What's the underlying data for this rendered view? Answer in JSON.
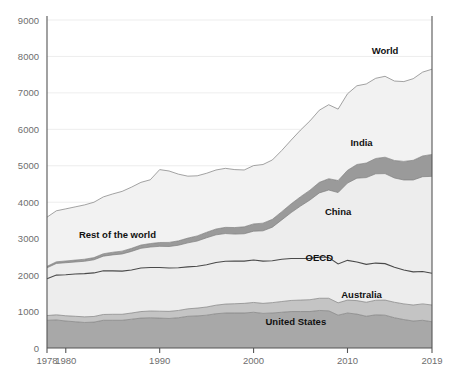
{
  "chart_data": {
    "type": "area",
    "title": "",
    "subtitle": "",
    "xlabel": "",
    "ylabel": "",
    "stacked": true,
    "grid": true,
    "legend_position": "inline-annotations",
    "xlim": [
      1978,
      2019
    ],
    "ylim": [
      0,
      9000
    ],
    "y_ticks": [
      0,
      1000,
      2000,
      3000,
      4000,
      5000,
      6000,
      7000,
      8000,
      9000
    ],
    "y_tick_labels": [
      "0",
      "1000",
      "2000",
      "3000",
      "4000",
      "5000",
      "6000",
      "7000",
      "8000",
      "9000"
    ],
    "x_ticks": [
      1978,
      1980,
      1990,
      2000,
      2010,
      2019
    ],
    "x_tick_labels": [
      "1978",
      "1980",
      "1990",
      "2000",
      "2010",
      "2019"
    ],
    "x": [
      1978,
      1979,
      1980,
      1981,
      1982,
      1983,
      1984,
      1985,
      1986,
      1987,
      1988,
      1989,
      1990,
      1991,
      1992,
      1993,
      1994,
      1995,
      1996,
      1997,
      1998,
      1999,
      2000,
      2001,
      2002,
      2003,
      2004,
      2005,
      2006,
      2007,
      2008,
      2009,
      2010,
      2011,
      2012,
      2013,
      2014,
      2015,
      2016,
      2017,
      2018,
      2019
    ],
    "series": [
      {
        "name": "United States",
        "label": "United States",
        "color": "#a8a8a8",
        "values": [
          760,
          770,
          740,
          720,
          700,
          710,
          760,
          760,
          760,
          790,
          820,
          830,
          820,
          810,
          830,
          870,
          880,
          900,
          940,
          960,
          960,
          960,
          980,
          950,
          960,
          980,
          1000,
          1000,
          1000,
          1030,
          1020,
          900,
          960,
          930,
          870,
          910,
          900,
          830,
          780,
          740,
          760,
          720
        ]
      },
      {
        "name": "Australia",
        "label": "Australia",
        "color": "#c4c4c4",
        "values": [
          130,
          140,
          145,
          150,
          155,
          155,
          160,
          165,
          165,
          170,
          180,
          185,
          190,
          195,
          200,
          205,
          215,
          225,
          235,
          245,
          255,
          265,
          270,
          275,
          285,
          295,
          305,
          315,
          325,
          335,
          345,
          340,
          355,
          370,
          385,
          400,
          415,
          425,
          430,
          440,
          450,
          460
        ]
      },
      {
        "name": "OECD (rest)",
        "label": "OECD",
        "color": "#ededed",
        "values": [
          1010,
          1090,
          1125,
          1160,
          1185,
          1195,
          1200,
          1190,
          1185,
          1180,
          1195,
          1195,
          1200,
          1190,
          1170,
          1150,
          1150,
          1160,
          1170,
          1175,
          1170,
          1160,
          1165,
          1160,
          1150,
          1160,
          1150,
          1140,
          1135,
          1130,
          1120,
          1065,
          1090,
          1060,
          1040,
          1020,
          1000,
          960,
          930,
          910,
          890,
          870
        ]
      },
      {
        "name": "China",
        "label": "China",
        "color": "#ededed",
        "values": [
          300,
          320,
          330,
          330,
          340,
          360,
          400,
          440,
          470,
          510,
          540,
          560,
          580,
          590,
          620,
          660,
          690,
          740,
          760,
          760,
          740,
          750,
          790,
          830,
          920,
          1080,
          1260,
          1440,
          1600,
          1760,
          1850,
          1960,
          2120,
          2300,
          2380,
          2450,
          2470,
          2450,
          2470,
          2520,
          2600,
          2660
        ]
      },
      {
        "name": "India",
        "label": "India",
        "color": "#9a9a9a",
        "values": [
          40,
          45,
          48,
          52,
          56,
          60,
          66,
          72,
          78,
          84,
          90,
          96,
          105,
          112,
          120,
          130,
          140,
          150,
          160,
          170,
          180,
          190,
          200,
          210,
          215,
          225,
          240,
          255,
          270,
          290,
          310,
          330,
          350,
          375,
          400,
          420,
          450,
          480,
          510,
          540,
          570,
          600
        ]
      },
      {
        "name": "Rest of the world",
        "label": "Rest of the world",
        "color": "#f2f2f2",
        "values": [
          1350,
          1400,
          1430,
          1460,
          1490,
          1520,
          1560,
          1600,
          1640,
          1680,
          1720,
          1750,
          2000,
          1960,
          1830,
          1700,
          1650,
          1620,
          1620,
          1620,
          1590,
          1560,
          1600,
          1610,
          1630,
          1680,
          1750,
          1830,
          1900,
          1980,
          2030,
          1960,
          2100,
          2160,
          2170,
          2200,
          2220,
          2180,
          2190,
          2240,
          2300,
          2340
        ]
      }
    ],
    "totals_label": "World",
    "annotations": [
      {
        "text": "World",
        "x": 2014.0,
        "y": 8080,
        "series": "World"
      },
      {
        "text": "India",
        "x": 2011.5,
        "y": 5550,
        "series": "India"
      },
      {
        "text": "China",
        "x": 2009.0,
        "y": 3650,
        "series": "China"
      },
      {
        "text": "OECD",
        "x": 2007.0,
        "y": 2380,
        "series": "OECD"
      },
      {
        "text": "Australia",
        "x": 2011.5,
        "y": 1380,
        "series": "Australia"
      },
      {
        "text": "United States",
        "x": 2004.5,
        "y": 620,
        "series": "United States"
      },
      {
        "text": "Rest of the world",
        "x": 1985.5,
        "y": 3020,
        "series": "Rest of the world"
      }
    ],
    "oecd_boundary_note": "dark line marking top of OECD band"
  },
  "colors": {
    "background": "#ffffff",
    "axis": "#555555",
    "grid": "#e9e9e9",
    "tick_text": "#6e6e6e",
    "label_text": "#111111"
  }
}
